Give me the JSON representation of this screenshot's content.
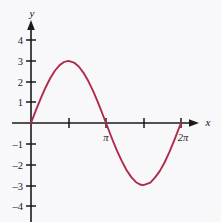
{
  "figure": {
    "background_color": "#f8f8fa",
    "axis_color": "#1a1a1a",
    "curve_color": "#b02a4a"
  },
  "axes": {
    "x_axis_label": "x",
    "y_axis_label": "y"
  },
  "chart_data": {
    "type": "line",
    "title": "",
    "subtitle": "",
    "xlabel": "x",
    "ylabel": "y",
    "function": "y = 3 sin(x)",
    "amplitude": 3,
    "period": "2π",
    "grid": false,
    "legend": "none",
    "xlim": [
      0,
      6.8067
    ],
    "ylim": [
      -4.4,
      4.6
    ],
    "x_tick_values": [
      1.5708,
      3.14159,
      4.71239,
      6.28319
    ],
    "x_tick_labels": [
      "",
      "π",
      "",
      "2π"
    ],
    "y_tick_values": [
      4,
      3,
      2,
      1,
      -1,
      -2,
      -3,
      -4
    ],
    "y_tick_labels": [
      "4",
      "3",
      "2",
      "1",
      "–1",
      "–2",
      "–3",
      "–4"
    ],
    "x": [
      0,
      0.2,
      0.4,
      0.6,
      0.8,
      1.0,
      1.2,
      1.4,
      1.5708,
      1.8,
      2.0,
      2.2,
      2.4,
      2.6,
      2.8,
      3.0,
      3.14159,
      3.4,
      3.6,
      3.8,
      4.0,
      4.2,
      4.4,
      4.6,
      4.71239,
      5.0,
      5.2,
      5.4,
      5.6,
      5.8,
      6.0,
      6.2,
      6.28319
    ],
    "y": [
      0,
      0.596,
      1.168,
      1.693,
      2.152,
      2.524,
      2.796,
      2.955,
      3.0,
      2.921,
      2.728,
      2.425,
      2.027,
      1.548,
      1.012,
      0.423,
      0,
      -0.772,
      -1.337,
      -1.831,
      -2.271,
      -2.616,
      -2.861,
      -2.985,
      -3.0,
      -2.877,
      -2.627,
      -2.313,
      -1.896,
      -1.395,
      -0.838,
      -0.249,
      0
    ],
    "zeros": [
      0,
      3.14159,
      6.28319
    ],
    "maxima": [
      {
        "x": 1.5708,
        "y": 3
      }
    ],
    "minima": [
      {
        "x": 4.71239,
        "y": -3
      }
    ]
  }
}
